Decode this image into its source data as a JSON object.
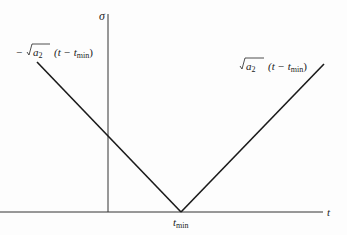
{
  "diagram": {
    "axes": {
      "y_label": "σ",
      "x_label": "t",
      "x_tick_label": "t",
      "x_tick_sub": "min"
    },
    "left_line_label": {
      "prefix": "−",
      "sqrt_arg": "a",
      "sqrt_sub": "2",
      "paren": "(t − t",
      "paren_sub": "min",
      "close": ")"
    },
    "right_line_label": {
      "sqrt_arg": "a",
      "sqrt_sub": "2",
      "paren": "(t − t",
      "paren_sub": "min",
      "close": ")"
    },
    "colors": {
      "line": "#1a1a1a",
      "axis": "#333333"
    }
  }
}
